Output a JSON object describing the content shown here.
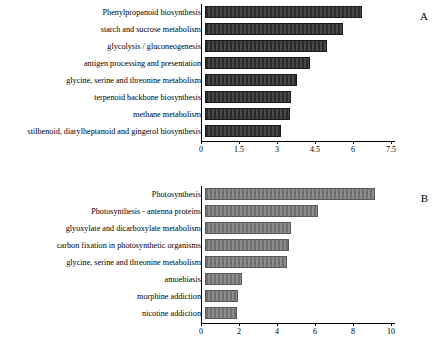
{
  "chart_data": [
    {
      "type": "bar",
      "panel": "A",
      "orientation": "horizontal",
      "title": "",
      "xlabel": "",
      "ylabel": "",
      "xlim": [
        0,
        7.5
      ],
      "xticks": [
        "0",
        "1.5",
        "3",
        "4.5",
        "6",
        "7.5"
      ],
      "grid": false,
      "bar_color": "#333333",
      "categories": [
        "Phenylpropanoid biosynthesis",
        "starch and sucrose metabolism",
        "glycolysis / gluconeogenesis",
        "antigen processing and presentation",
        "glycine, serine and threonine metabolism",
        "terpenoid backbone biosynthesis",
        "methane metabolism",
        "stilbenoid, diarylheptanoid and gingerol biosynthesis"
      ],
      "values": [
        6.2,
        5.45,
        4.8,
        4.15,
        3.65,
        3.4,
        3.35,
        3.0
      ]
    },
    {
      "type": "bar",
      "panel": "B",
      "orientation": "horizontal",
      "title": "",
      "xlabel": "",
      "ylabel": "",
      "xlim": [
        0,
        10
      ],
      "xticks": [
        "0",
        "2",
        "4",
        "6",
        "8",
        "10"
      ],
      "grid": false,
      "bar_color": "#808080",
      "categories": [
        "Photosynthesis",
        "Photosynthesis - antenna proteins",
        "glyoxylate and dicarboxylate metabolism",
        "carbon fixation in photosynthetic organisms",
        "glycine, serine and threonine metabolism",
        "amoebiasis",
        "morphine addiction",
        "nicotine addiction"
      ],
      "values": [
        8.95,
        5.95,
        4.5,
        4.4,
        4.3,
        1.95,
        1.75,
        1.7
      ]
    }
  ],
  "panels": {
    "a": {
      "letter": "A",
      "labels": [
        "Phenylpropanoid biosynthesis",
        "starch and sucrose metabolism",
        "glycolysis / gluconeogenesis",
        "antigen processing and presentation",
        "glycine, serine and threonine metabolism",
        "terpenoid backbone biosynthesis",
        "methane metabolism",
        "stilbenoid, diarylheptanoid and gingerol biosynthesis"
      ],
      "ticks": [
        "0",
        "1.5",
        "3",
        "4.5",
        "6",
        "7.5"
      ]
    },
    "b": {
      "letter": "B",
      "labels": [
        "Photosynthesis",
        "Photosynthesis - antenna proteins",
        "glyoxylate and dicarboxylate metabolism",
        "carbon fixation in photosynthetic organisms",
        "glycine, serine and threonine metabolism",
        "amoebiasis",
        "morphine addiction",
        "nicotine addiction"
      ],
      "ticks": [
        "0",
        "2",
        "4",
        "6",
        "8",
        "10"
      ]
    }
  }
}
